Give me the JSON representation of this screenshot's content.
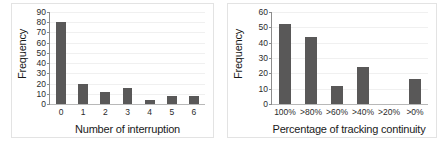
{
  "chart_data": [
    {
      "type": "bar",
      "title": "",
      "xlabel": "Number of interruption",
      "ylabel": "Frequency",
      "categories": [
        "0",
        "1",
        "2",
        "3",
        "4",
        "5",
        "6"
      ],
      "values": [
        80,
        20,
        12,
        16,
        4,
        8,
        8
      ],
      "ylim": [
        0,
        90
      ],
      "yticks": [
        0,
        10,
        20,
        30,
        40,
        50,
        60,
        70,
        80,
        90
      ],
      "grid": true,
      "legend": "none",
      "bar_color": "#595858"
    },
    {
      "type": "bar",
      "title": "",
      "xlabel": "Percentage of tracking continuity",
      "ylabel": "Frequency",
      "categories": [
        "100%",
        ">80%",
        ">60%",
        ">40%",
        ">20%",
        ">0%"
      ],
      "values": [
        52,
        44,
        12,
        24,
        0,
        16
      ],
      "ylim": [
        0,
        60
      ],
      "yticks": [
        0,
        10,
        20,
        30,
        40,
        50,
        60
      ],
      "grid": true,
      "legend": "none",
      "bar_color": "#595858"
    }
  ]
}
